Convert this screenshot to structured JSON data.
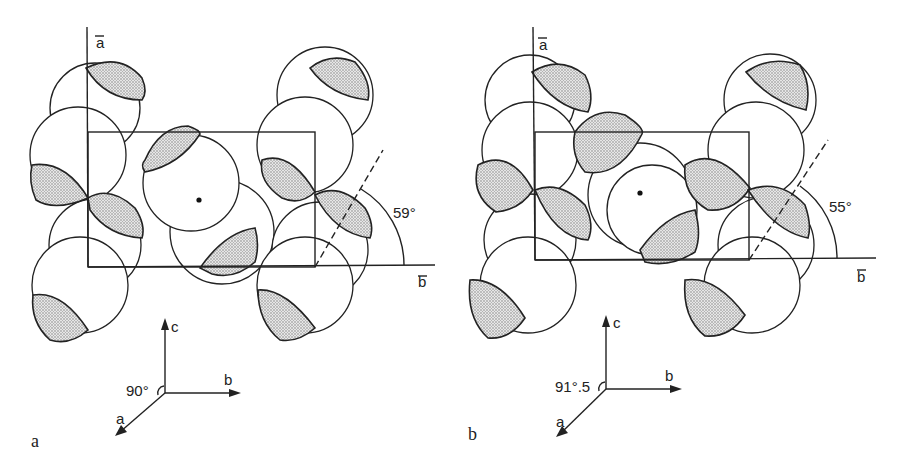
{
  "figure": {
    "panels": [
      {
        "id": "a",
        "label": "a",
        "cell_axes": {
          "vertical": "a",
          "horizontal": "b"
        },
        "tilt_angle_label": "59°",
        "triad": {
          "up": "c",
          "right": "b",
          "diag": "a",
          "angle_label": "90°"
        }
      },
      {
        "id": "b",
        "label": "b",
        "cell_axes": {
          "vertical": "a",
          "horizontal": "b"
        },
        "tilt_angle_label": "55°",
        "triad": {
          "up": "c",
          "right": "b",
          "diag": "a",
          "angle_label": "91°.5"
        }
      }
    ],
    "colors": {
      "ink": "#222222",
      "shade": "#b8b8b8",
      "background": "#ffffff"
    }
  }
}
